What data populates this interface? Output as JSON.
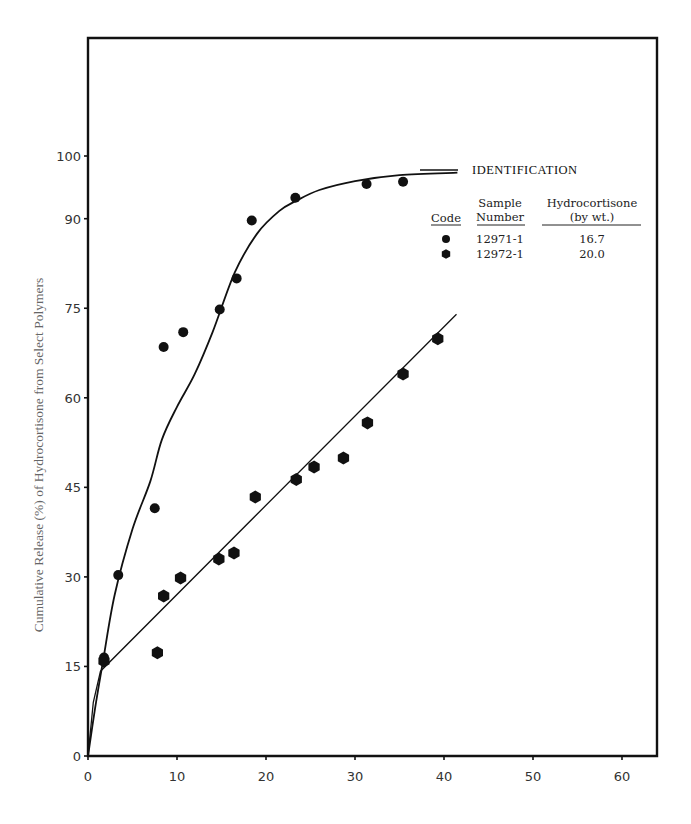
{
  "chart_data": {
    "type": "scatter",
    "title": "",
    "xlabel": "",
    "ylabel": "Cumulative Release (%) of Hydrocortisone from Select Polymers",
    "xlim": [
      0,
      64
    ],
    "ylim": [
      0,
      120
    ],
    "x_ticks": [
      0,
      10,
      20,
      30,
      40,
      50,
      60
    ],
    "y_ticks": [
      0,
      15,
      30,
      45,
      60,
      75,
      90,
      100
    ],
    "grid": false,
    "legend_position": "upper right (inside)",
    "legend": {
      "title": "IDENTIFICATION",
      "columns": [
        "Code",
        "Sample Number",
        "Hydrocortisone (by wt.)"
      ],
      "entries": [
        {
          "marker": "circle",
          "sample_number": "12971-1",
          "hydrocortisone": "16.7"
        },
        {
          "marker": "hexagon",
          "sample_number": "12972-1",
          "hydrocortisone": "20.0"
        }
      ]
    },
    "series": [
      {
        "name": "12971-1",
        "marker": "circle",
        "points": [
          [
            1.8,
            16.5
          ],
          [
            3.4,
            30.3
          ],
          [
            7.5,
            41.5
          ],
          [
            8.5,
            68.5
          ],
          [
            10.7,
            71
          ],
          [
            14.8,
            74.8
          ],
          [
            16.7,
            80
          ],
          [
            18.4,
            89.7
          ],
          [
            23.3,
            93.5
          ],
          [
            31.3,
            95.8
          ],
          [
            35.4,
            96.2
          ]
        ],
        "fit_curve": [
          [
            0,
            0
          ],
          [
            0.8,
            8
          ],
          [
            1.7,
            16
          ],
          [
            3,
            27
          ],
          [
            5,
            38
          ],
          [
            7,
            46
          ],
          [
            8.3,
            53
          ],
          [
            10,
            58.5
          ],
          [
            12,
            64
          ],
          [
            14,
            71
          ],
          [
            16.5,
            81
          ],
          [
            19,
            87.5
          ],
          [
            21.5,
            91.3
          ],
          [
            23.4,
            93
          ],
          [
            26,
            94.8
          ],
          [
            30,
            96.3
          ],
          [
            35,
            97.3
          ],
          [
            41.5,
            97.7
          ]
        ]
      },
      {
        "name": "12972-1",
        "marker": "hexagon",
        "points": [
          [
            1.8,
            15.9
          ],
          [
            7.8,
            17.3
          ],
          [
            8.5,
            26.8
          ],
          [
            10.4,
            29.8
          ],
          [
            14.7,
            33
          ],
          [
            16.4,
            34
          ],
          [
            18.8,
            43.4
          ],
          [
            23.4,
            46.3
          ],
          [
            25.4,
            48.4
          ],
          [
            28.7,
            49.9
          ],
          [
            31.4,
            55.8
          ],
          [
            35.4,
            64
          ],
          [
            39.3,
            69.9
          ]
        ],
        "fit_curve": [
          [
            0,
            0
          ],
          [
            0.6,
            9
          ],
          [
            1.4,
            14.2
          ],
          [
            41.4,
            74
          ]
        ]
      }
    ]
  }
}
